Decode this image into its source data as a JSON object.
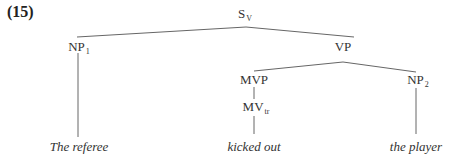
{
  "example_number": "(15)",
  "tree": {
    "root": {
      "label": "S",
      "sub": "V"
    },
    "np1": {
      "label": "NP",
      "sub": "1"
    },
    "vp": {
      "label": "VP",
      "sub": ""
    },
    "mvp": {
      "label": "MVP",
      "sub": ""
    },
    "np2": {
      "label": "NP",
      "sub": "2"
    },
    "mv": {
      "label": "MV",
      "sub": "tr"
    },
    "leaves": {
      "np1": "The referee",
      "mv": "kicked out",
      "np2": "the player"
    }
  },
  "colors": {
    "lines": "#555555",
    "text": "#333333"
  }
}
